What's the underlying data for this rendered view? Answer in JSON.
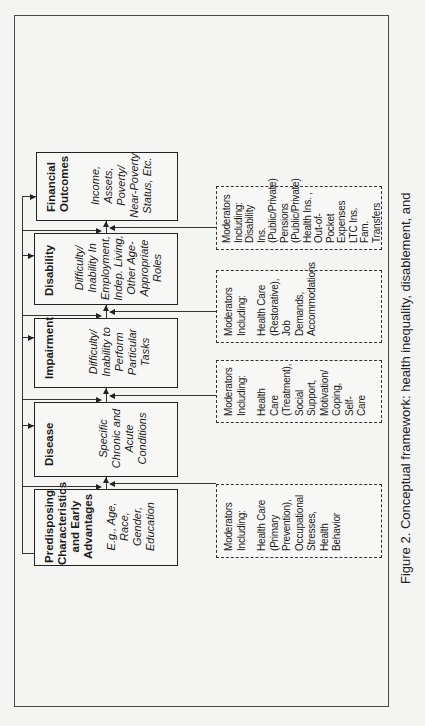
{
  "figure": {
    "caption": "Figure 2.  Conceptual framework: health inequality, disablement, and",
    "orientation": "rotated 90 degrees counter-clockwise"
  },
  "stages": [
    {
      "id": "predisposing",
      "title": "Predisposing Characteristics and Early Advantages",
      "title_lines": [
        "Predisposing",
        "Characteristics",
        "and Early",
        "Advantages"
      ],
      "description": "E.g., Age, Race, Gender, Education",
      "desc_lines": [
        "E.g., Age, Race,",
        "Gender,",
        "Education"
      ]
    },
    {
      "id": "disease",
      "title": "Disease",
      "title_lines": [
        "Disease"
      ],
      "description": "Specific Chronic and Acute Conditions",
      "desc_lines": [
        "Specific",
        "Chronic and",
        "Acute",
        "Conditions"
      ]
    },
    {
      "id": "impairment",
      "title": "Impairment",
      "title_lines": [
        "Impairment"
      ],
      "description": "Difficulty/ Inability to Perform Particular Tasks",
      "desc_lines": [
        "Difficulty/",
        "Inability to",
        "Perform",
        "Particular",
        "Tasks"
      ]
    },
    {
      "id": "disability",
      "title": "Disability",
      "title_lines": [
        "Disability"
      ],
      "description": "Difficulty/ Inability In Employment, Indep. Living, Other Age-Appropriate Roles",
      "desc_lines": [
        "Difficulty/",
        "Inability In",
        "Employment,",
        "Indep. Living,",
        "Other Age-",
        "Appropriate",
        "Roles"
      ]
    },
    {
      "id": "financial",
      "title": "Financial Outcomes",
      "title_lines": [
        "Financial",
        "Outcomes"
      ],
      "description": "Income, Assets, Poverty/ Near-Poverty Status, Etc.",
      "desc_lines": [
        "Income,",
        "Assets,",
        "Poverty/",
        "Near-Poverty",
        "Status, Etc."
      ]
    }
  ],
  "moderators": [
    {
      "id": "mod-disease",
      "heading": "Moderators\nIncluding:",
      "body": "Health Care\n(Primary\nPrevention),\nOccupational\nStresses,\nHealth\nBehavior"
    },
    {
      "id": "mod-impairment",
      "heading": "Moderators\nIncluding:",
      "body": "Health Care\n(Treatment),\nSocial\nSupport,\nMotivation/\nCoping, Self-\nCare"
    },
    {
      "id": "mod-disability",
      "heading": "Moderators\nIncluding:",
      "body": "Health Care\n(Restorative),\nJob Demands,\nAccommodations"
    },
    {
      "id": "mod-financial",
      "heading": "Moderators\nIncluding:",
      "body": "Disability Ins.\n(Public/Private)\nPensions\n(Public/Private)\nHealth Ins. ,\nOut-of-Pocket\nExpenses\nLTC Ins.\nFam. Transfers"
    }
  ],
  "colors": {
    "background": "#f4f4f2",
    "ink": "#222222",
    "frame": "#4a4a4a"
  }
}
